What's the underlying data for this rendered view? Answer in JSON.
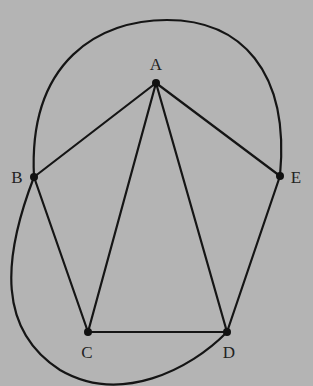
{
  "diagram": {
    "type": "graph",
    "background": "#b4b4b4",
    "line_color": "#151515",
    "vertices": [
      {
        "id": "A",
        "label": "A",
        "x": 156,
        "y": 83,
        "lx": 156,
        "ly": 70
      },
      {
        "id": "B",
        "label": "B",
        "x": 34,
        "y": 177,
        "lx": 17,
        "ly": 183
      },
      {
        "id": "C",
        "label": "C",
        "x": 88,
        "y": 332,
        "lx": 87,
        "ly": 358
      },
      {
        "id": "D",
        "label": "D",
        "x": 227,
        "y": 332,
        "lx": 229,
        "ly": 358
      },
      {
        "id": "E",
        "label": "E",
        "x": 280,
        "y": 176,
        "lx": 296,
        "ly": 183
      }
    ],
    "straight_edges": [
      [
        "A",
        "B"
      ],
      [
        "A",
        "C"
      ],
      [
        "A",
        "D"
      ],
      [
        "A",
        "E"
      ],
      [
        "B",
        "C"
      ],
      [
        "C",
        "D"
      ],
      [
        "D",
        "E"
      ]
    ],
    "curved_edges": [
      {
        "from": "B",
        "to": "E",
        "path": "M34,177 C28,60 100,20 167,20 C240,20 290,70 280,176"
      },
      {
        "from": "B",
        "to": "D",
        "path": "M34,177 C2,260 -2,330 60,370 C120,405 190,370 227,332"
      }
    ]
  }
}
